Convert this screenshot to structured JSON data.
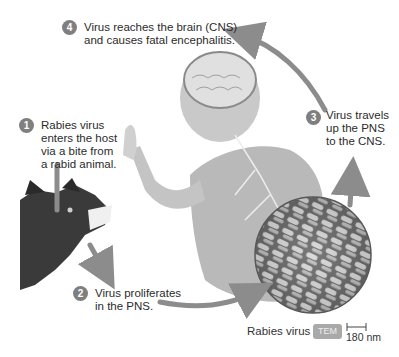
{
  "steps": [
    {
      "number": "1",
      "text": "Rabies virus\nenters the host\nvia a bite from\na rabid animal."
    },
    {
      "number": "2",
      "text": "Virus proliferates\nin the PNS."
    },
    {
      "number": "3",
      "text": "Virus travels\nup the PNS\nto the CNS."
    },
    {
      "number": "4",
      "text": "Virus reaches the brain (CNS)\nand causes fatal encephalitis."
    }
  ],
  "micrograph": {
    "label": "Rabies virus",
    "badge": "TEM",
    "scale": "180 nm"
  },
  "illustrations": {
    "animal": "rabid dog",
    "host": "human with exposed brain and nerves"
  },
  "colors": {
    "arrow": "#8c8c8c",
    "badge": "#7f7f7f"
  }
}
